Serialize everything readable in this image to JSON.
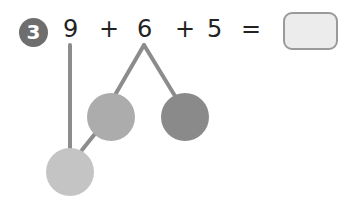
{
  "question": {
    "number": "3",
    "expression": [
      {
        "text": "9",
        "x": 63
      },
      {
        "text": "+",
        "x": 99
      },
      {
        "text": "6",
        "x": 137
      },
      {
        "text": "+",
        "x": 175
      },
      {
        "text": "5",
        "x": 207
      },
      {
        "text": "=",
        "x": 241
      }
    ],
    "answer_box": ""
  },
  "colors": {
    "badge": "#6e6e6e",
    "line": "#8c8c8c",
    "circle_light": "#c4c4c4",
    "circle_mid": "#acacac",
    "circle_dark": "#8a8a8a"
  }
}
